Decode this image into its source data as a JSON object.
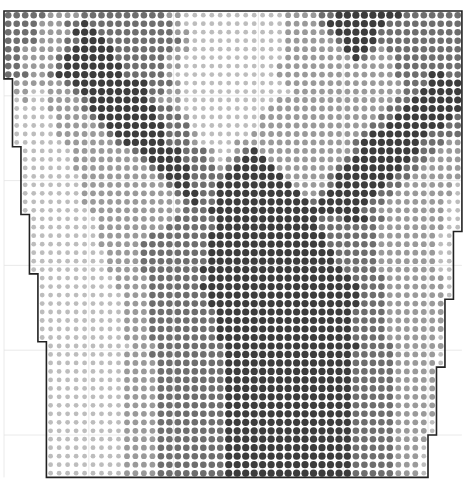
{
  "chart_data": {
    "type": "heatmap",
    "title": "",
    "grid": {
      "columns": 54,
      "rows": 55,
      "cell_px": 8.48,
      "origin_x": 4,
      "origin_y": 11,
      "guide_every": 10
    },
    "shade_colors": [
      "#d9d9d9",
      "#bdbdbd",
      "#9a9a9a",
      "#6e6e6e",
      "#3c3c3c"
    ],
    "dot_radius": [
      2.0,
      2.4,
      2.9,
      3.3,
      3.6
    ],
    "outline_color": "#222222",
    "left_steps": [
      {
        "row_start": 0,
        "col_start": 0
      },
      {
        "row_start": 8,
        "col_start": 1
      },
      {
        "row_start": 16,
        "col_start": 2
      },
      {
        "row_start": 24,
        "col_start": 3
      },
      {
        "row_start": 31,
        "col_start": 4
      },
      {
        "row_start": 39,
        "col_start": 5
      }
    ],
    "right_steps": [
      {
        "row_start": 0,
        "col_end": 54
      },
      {
        "row_start": 26,
        "col_end": 53
      },
      {
        "row_start": 18,
        "col_end": 54
      },
      {
        "row_start": 34,
        "col_end": 52
      },
      {
        "row_start": 42,
        "col_end": 51
      },
      {
        "row_start": 50,
        "col_end": 50
      }
    ],
    "rows": [
      "333332222333333333322111111111111222233444444443333333",
      "333322233433333333332111111111111222234444444333333333",
      "333322224443333333332211111111111222223444443333333333",
      "333322233444333333333211111111111222222344443333333333",
      "332222234444433333332211111111111222222244432333333333",
      "332222344444433333322111111111111222222224322233333333",
      "332222344444443333322111111111112222222222222233333333",
      "333223444444443333321111111111112222222222222233334433",
      "22222234444444443332111111111111222222222222223334444",
      "22112223444444443322111111111111122222222222223344444",
      "12112222344444443222111111111112222222222222233444444",
      "11112222344444444332111111111122222222222222334444444",
      "11111222234444444333211111111222222222222223344444443",
      "11111222223444444433311111111222222222222233444444433",
      "11111222222344444433321111112222222222222344444443333",
      "11111122222234444433321111222222222222223444444433322",
      "1111112222222344444333211234222222222223444444433222",
      "1111112222222234444333212344422222222234444444332222",
      "1111112222222223444433323444442222222344444443322222",
      "1111111222222222344433334444444222223444444433222222",
      "1111111222222222234433344444444422223444444332222221",
      "1111111222222222223443344444444442234444443322222221",
      "1111111222222222222343344444444444344444433222222211",
      "1111111122222222222333444444444444444444332222222211",
      "111111112222222223333344444444444433344433222222211",
      "111111112222222233333344444444444433333332222222211",
      "111111112222223333333444444444444443333332222222111",
      "111111112222233333333444444444444443333332222222111",
      "111111111222233333333444444444444444333332222222111",
      "11111111122223333333344444444444444433333222222211",
      "11111111122223333333444444444444444443333222222211",
      "11111111122223333333444444444444444443333222222211",
      "11111111122223333334444444444444444444333222222211",
      "1111111111222333333344444444444444444433322222221",
      "1111111111222333333344444444444444444433322222221",
      "1111111111222333333334444444444444444333322222221",
      "1111111111222333333334444444444444444333322222221",
      "1111111111222333333334444444444444444333322222221",
      "111111111122233333333444444444444444433332222221",
      "111111111122233333333444444444444444433332222221",
      "11111111122233333333344444444444444433333222221",
      "11111111122223333333344444444444444433333222221",
      "11111111122223333333344444444444444433333222221",
      "11111111122223333333344444444444444433333222221",
      "11111111122223333333344444444444444433333222221",
      "11111111122223333333344444444444444433333222221",
      "1111111112222333333334444444444444443333322222",
      "1111111112222333333334444444444444443333322222",
      "1111111112222333333334444444444444443333322221",
      "1111111112222333333334444444444444443333322221",
      "1111111112222333333334444444444444443333322221",
      "111111111222233333333444444444444444333332221",
      "111111111222233333333444444444444444333332221",
      "111111111222233333333444444444444444333332221",
      "111111111222233333333444444444444444333332221"
    ]
  }
}
